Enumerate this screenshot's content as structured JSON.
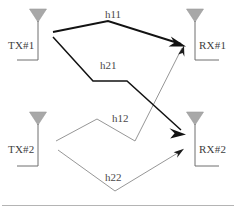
{
  "figure": {
    "type": "mimo-channel-diagram",
    "width": 236,
    "height": 214,
    "background": "#ffffff",
    "divider": {
      "name": "bottom-divider",
      "y": 205,
      "x1": 2,
      "x2": 234,
      "color": "#b4b4b4"
    }
  },
  "colors": {
    "antenna_fill": "#a8a8a8",
    "antenna_stroke": "#9a9a9a",
    "node_line": "#6e6e6e",
    "strong_path": "#121212",
    "weak_path": "#8a8a8a",
    "text": "#3d3d3d",
    "divider": "#b4b4b4"
  },
  "nodes": [
    {
      "id": "tx1",
      "label": "TX#1",
      "icon": "antenna-icon",
      "side": "left",
      "triangle": {
        "cx": 38,
        "top": 9,
        "width": 17,
        "height": 13
      },
      "stem": {
        "x": 38,
        "y1": 22,
        "y2": 60
      },
      "base": {
        "x1": 38,
        "x2": 17,
        "y": 60
      },
      "label_pos": {
        "x": 8,
        "y": 40
      }
    },
    {
      "id": "tx2",
      "label": "TX#2",
      "icon": "antenna-icon",
      "side": "left",
      "triangle": {
        "cx": 38,
        "top": 112,
        "width": 17,
        "height": 13
      },
      "stem": {
        "x": 38,
        "y1": 125,
        "y2": 166
      },
      "base": {
        "x1": 38,
        "x2": 17,
        "y": 166
      },
      "label_pos": {
        "x": 8,
        "y": 144
      }
    },
    {
      "id": "rx1",
      "label": "RX#1",
      "icon": "antenna-icon",
      "side": "right",
      "triangle": {
        "cx": 195,
        "top": 9,
        "width": 17,
        "height": 13
      },
      "stem": {
        "x": 195,
        "y1": 22,
        "y2": 60
      },
      "base": {
        "x1": 195,
        "x2": 219,
        "y": 60
      },
      "label_pos": {
        "x": 199,
        "y": 40
      }
    },
    {
      "id": "rx2",
      "label": "RX#2",
      "icon": "antenna-icon",
      "side": "right",
      "triangle": {
        "cx": 195,
        "top": 112,
        "width": 17,
        "height": 13
      },
      "stem": {
        "x": 195,
        "y1": 125,
        "y2": 166
      },
      "base": {
        "x1": 195,
        "x2": 219,
        "y": 166
      },
      "label_pos": {
        "x": 199,
        "y": 144
      }
    }
  ],
  "paths": [
    {
      "id": "h11",
      "label": "h11",
      "from": "tx1",
      "to": "rx1",
      "weight": "strong",
      "stroke_width": 1.9,
      "points": "53,32 108,21 181,44",
      "arrow": {
        "x": 183,
        "y": 45,
        "angle": 18,
        "size": "large"
      },
      "label_pos": {
        "x": 105,
        "y": 9
      }
    },
    {
      "id": "h21",
      "label": "h21",
      "from": "tx1",
      "to": "rx2",
      "weight": "strong",
      "stroke_width": 1.6,
      "points": "53,37 93,81 127,81 181,130",
      "arrow": {
        "x": 183,
        "y": 132,
        "angle": 42,
        "size": "large"
      },
      "label_pos": {
        "x": 100,
        "y": 60
      }
    },
    {
      "id": "h12",
      "label": "h12",
      "from": "tx2",
      "to": "rx1",
      "weight": "weak",
      "stroke_width": 0.9,
      "points": "56,141 97,119 135,141 182,48",
      "arrow": {
        "x": 184,
        "y": 46,
        "angle": -63,
        "size": "small"
      },
      "label_pos": {
        "x": 112,
        "y": 113
      }
    },
    {
      "id": "h22",
      "label": "h22",
      "from": "tx2",
      "to": "rx2",
      "weight": "weak",
      "stroke_width": 0.9,
      "points": "58,150 115,191 181,151",
      "arrow": {
        "x": 183,
        "y": 150,
        "angle": -31,
        "size": "small"
      },
      "label_pos": {
        "x": 105,
        "y": 172
      }
    }
  ]
}
